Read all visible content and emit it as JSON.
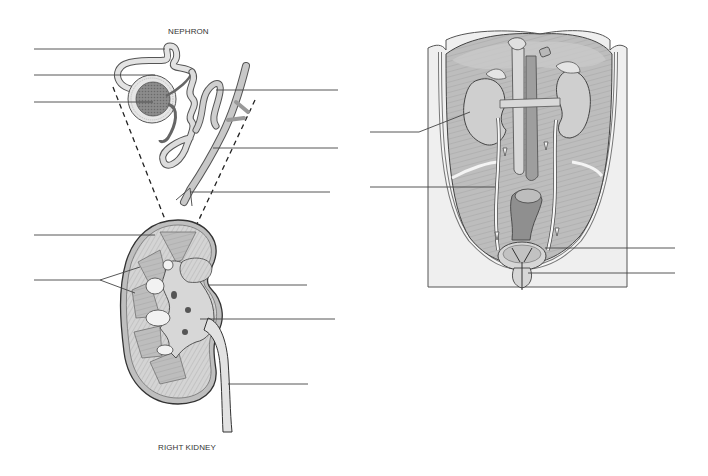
{
  "diagram": {
    "type": "anatomy-worksheet",
    "colors": {
      "background": "#ffffff",
      "line": "#444444",
      "tissue_light": "#d9d9d9",
      "tissue_mid": "#b8b8b8",
      "tissue_dark": "#8a8a8a",
      "skin": "#efefef"
    }
  },
  "figures": [
    {
      "id": "nephron",
      "title": "NEPHRON",
      "label_lines": [
        {
          "side": "left",
          "y": 49,
          "text": ""
        },
        {
          "side": "left",
          "y": 75,
          "text": ""
        },
        {
          "side": "left",
          "y": 102,
          "text": ""
        },
        {
          "side": "right",
          "y": 90,
          "text": ""
        },
        {
          "side": "right",
          "y": 148,
          "text": ""
        },
        {
          "side": "right",
          "y": 192,
          "text": ""
        }
      ]
    },
    {
      "id": "right-kidney",
      "title": "RIGHT KIDNEY",
      "label_lines": [
        {
          "side": "left",
          "y": 235,
          "text": ""
        },
        {
          "side": "left",
          "y": 280,
          "text": "",
          "forked": true
        },
        {
          "side": "right",
          "y": 285,
          "text": ""
        },
        {
          "side": "right",
          "y": 319,
          "text": ""
        },
        {
          "side": "right",
          "y": 384,
          "text": ""
        }
      ]
    },
    {
      "id": "torso",
      "title": "",
      "label_lines": [
        {
          "side": "left",
          "y": 132,
          "text": ""
        },
        {
          "side": "left",
          "y": 187,
          "text": ""
        },
        {
          "side": "right",
          "y": 248,
          "text": ""
        },
        {
          "side": "right",
          "y": 273,
          "text": ""
        }
      ]
    }
  ]
}
